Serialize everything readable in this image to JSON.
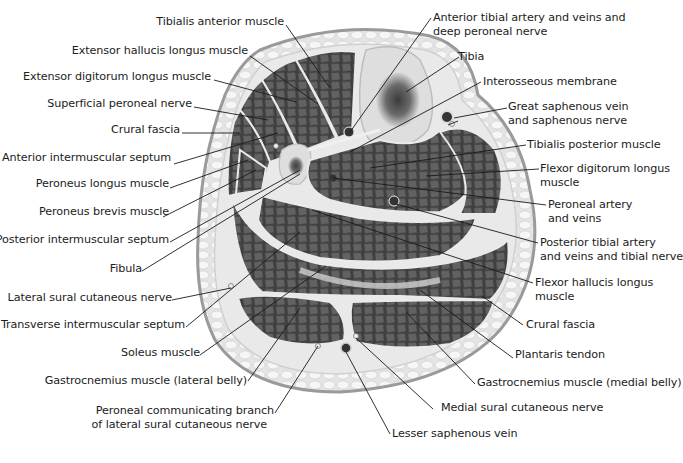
{
  "diagram": {
    "colors": {
      "background": "#ffffff",
      "skin_outline": "#9a9a9a",
      "subcutaneous_fat": "#e6e6e6",
      "fat_cells": "#f4f4f4",
      "muscle": "#5a5a5a",
      "muscle_fascicle": "#6c6c6c",
      "fascia": "#e8e8e8",
      "bone_cortex": "#dcdcdc",
      "bone_marrow": "#4a4a4a",
      "leader_line": "#1a1a1a",
      "text": "#1c1c1c"
    },
    "labels_left": [
      {
        "id": "tibialis-anterior",
        "text": "Tibialis anterior muscle"
      },
      {
        "id": "ext-hallucis",
        "text": "Extensor hallucis longus muscle"
      },
      {
        "id": "ext-digitorum",
        "text": "Extensor digitorum longus muscle"
      },
      {
        "id": "sup-peroneal-nerve",
        "text": "Superficial peroneal nerve"
      },
      {
        "id": "crural-fascia-left",
        "text": "Crural fascia"
      },
      {
        "id": "ant-intermuscular",
        "text": "Anterior intermuscular septum"
      },
      {
        "id": "peroneus-longus",
        "text": "Peroneus longus muscle"
      },
      {
        "id": "peroneus-brevis",
        "text": "Peroneus brevis muscle"
      },
      {
        "id": "post-intermuscular",
        "text": "Posterior intermuscular septum"
      },
      {
        "id": "fibula",
        "text": "Fibula"
      },
      {
        "id": "lat-sural",
        "text": "Lateral sural cutaneous nerve"
      },
      {
        "id": "transverse-septum",
        "text": "Transverse intermuscular septum"
      },
      {
        "id": "soleus",
        "text": "Soleus muscle"
      },
      {
        "id": "gastroc-lateral",
        "text": "Gastrocnemius muscle (lateral belly)"
      },
      {
        "id": "peroneal-comm-1",
        "text": "Peroneal communicating branch"
      },
      {
        "id": "peroneal-comm-2",
        "text": "of lateral sural cutaneous nerve"
      }
    ],
    "labels_right": [
      {
        "id": "ant-tibial-1",
        "text": "Anterior tibial artery and veins and"
      },
      {
        "id": "ant-tibial-2",
        "text": "deep peroneal nerve"
      },
      {
        "id": "tibia",
        "text": "Tibia"
      },
      {
        "id": "interosseous",
        "text": "Interosseous membrane"
      },
      {
        "id": "great-saph-1",
        "text": "Great saphenous vein"
      },
      {
        "id": "great-saph-2",
        "text": "and saphenous nerve"
      },
      {
        "id": "tib-posterior",
        "text": "Tibialis posterior muscle"
      },
      {
        "id": "flex-dig-1",
        "text": "Flexor digitorum longus"
      },
      {
        "id": "flex-dig-2",
        "text": "muscle"
      },
      {
        "id": "peroneal-art-1",
        "text": "Peroneal artery"
      },
      {
        "id": "peroneal-art-2",
        "text": "and veins"
      },
      {
        "id": "post-tibial-1",
        "text": "Posterior tibial artery"
      },
      {
        "id": "post-tibial-2",
        "text": "and veins and tibial nerve"
      },
      {
        "id": "flex-hal-1",
        "text": "Flexor hallucis longus"
      },
      {
        "id": "flex-hal-2",
        "text": "muscle"
      },
      {
        "id": "crural-fascia-right",
        "text": "Crural fascia"
      },
      {
        "id": "plantaris",
        "text": "Plantaris tendon"
      },
      {
        "id": "gastroc-medial",
        "text": "Gastrocnemius muscle (medial belly)"
      },
      {
        "id": "med-sural",
        "text": "Medial sural cutaneous nerve"
      },
      {
        "id": "lesser-saph",
        "text": "Lesser saphenous vein"
      }
    ]
  }
}
